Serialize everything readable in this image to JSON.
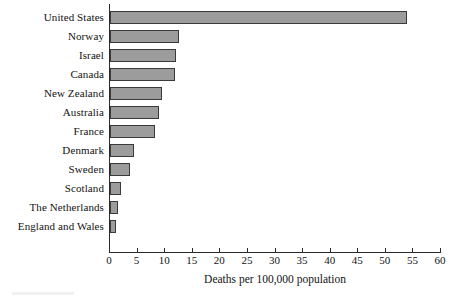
{
  "chart_data": {
    "type": "bar",
    "orientation": "horizontal",
    "title": "",
    "xlabel": "Deaths per 100,000 population",
    "ylabel": "",
    "xlim": [
      0,
      60
    ],
    "xticks": [
      0,
      5,
      10,
      15,
      20,
      25,
      30,
      35,
      40,
      45,
      50,
      55,
      60
    ],
    "xtick_labels": [
      "0",
      "5",
      "10",
      "15",
      "20",
      "25",
      "30",
      "35",
      "40",
      "45",
      "50",
      "55",
      "60"
    ],
    "grid": false,
    "legend": null,
    "categories": [
      "United States",
      "Norway",
      "Israel",
      "Canada",
      "New Zealand",
      "Australia",
      "France",
      "Denmark",
      "Sweden",
      "Scotland",
      "The Netherlands",
      "England and Wales"
    ],
    "values": [
      53.8,
      12.5,
      12.0,
      11.7,
      9.4,
      8.8,
      8.2,
      4.3,
      3.7,
      2.0,
      1.5,
      1.1
    ],
    "bar_fill_color": "#9c9c9c",
    "bar_border_color": "#3a3a3a",
    "axis_color": "#2b2b2b",
    "text_color": "#121212",
    "background_color": "#ffffff"
  }
}
